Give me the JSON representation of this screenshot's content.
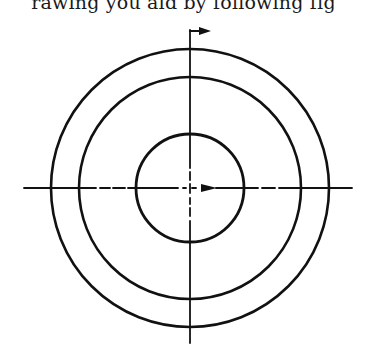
{
  "caption": {
    "text": "rawing you aid by following fig"
  },
  "diagram": {
    "type": "concentric-circles-with-centerlines",
    "stroke_color": "#111111",
    "center": {
      "x": 190,
      "y": 188
    },
    "circles": [
      {
        "name": "outer-circle",
        "r": 139
      },
      {
        "name": "middle-circle",
        "r": 111
      },
      {
        "name": "inner-circle",
        "r": 54
      }
    ],
    "horizontal_centerline": {
      "x1": 24,
      "x2": 352,
      "style": "dash-dot"
    },
    "vertical_centerline": {
      "y1": 30,
      "y2": 343,
      "style": "dash-dot"
    },
    "top_arrow": {
      "direction": "right",
      "label": "section arrow"
    },
    "center_arrow": {
      "direction": "right",
      "label": "direction arrow"
    }
  }
}
